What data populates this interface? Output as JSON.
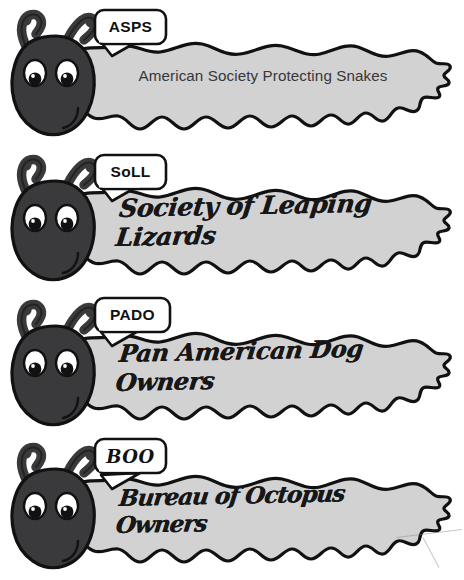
{
  "poster": {
    "title": "Caterpillar organization acronyms",
    "background_color": "#ffffff",
    "ink_color": "#111111",
    "head_color": "#3a3a3c",
    "body_color": "#d2d2d2",
    "eye_white": "#ffffff",
    "pupil_color": "#111111"
  },
  "creatures": [
    {
      "acronym": "ASPS",
      "acronym_style": "block",
      "name": "American Society Protecting Snakes",
      "name_style": "typed"
    },
    {
      "acronym": "SoLL",
      "acronym_style": "block",
      "name": "Society of Leaping Lizards",
      "name_style": "handwritten"
    },
    {
      "acronym": "PADO",
      "acronym_style": "block",
      "name": "Pan American Dog Owners",
      "name_style": "handwritten"
    },
    {
      "acronym": "BOO",
      "acronym_style": "handwritten",
      "name": "Bureau of Octopus Owners",
      "name_style": "handwritten"
    }
  ]
}
